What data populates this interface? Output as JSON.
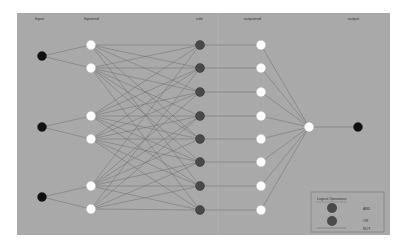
{
  "diagram": {
    "type": "neural-network-fuzzy-logic",
    "background_color": "#a9a9a9",
    "edge_color": "#6e6e6e",
    "columns": [
      {
        "id": "input",
        "label": "Input",
        "x": 42,
        "label_x": 35,
        "node_color": "#111111",
        "nodes_y": [
          56,
          127,
          197
        ]
      },
      {
        "id": "inputrnd",
        "label": "Inputrnd",
        "x": 91,
        "label_x": 84,
        "node_color": "#ffffff",
        "nodes_y": [
          45,
          68,
          116,
          139,
          186,
          209
        ]
      },
      {
        "id": "rule",
        "label": "rule",
        "x": 200,
        "label_x": 196,
        "node_color": "#4a4a4a",
        "nodes_y": [
          45,
          68,
          92,
          116,
          139,
          162,
          186,
          210
        ]
      },
      {
        "id": "outputrnd",
        "label": "outputrnd",
        "x": 261,
        "label_x": 244,
        "node_color": "#ffffff",
        "nodes_y": [
          45,
          68,
          92,
          116,
          139,
          162,
          186,
          210
        ]
      },
      {
        "id": "sum",
        "label": "",
        "x": 309,
        "node_color": "#ffffff",
        "nodes_y": [
          127
        ]
      },
      {
        "id": "output",
        "label": "output",
        "x": 358,
        "label_x": 348,
        "node_color": "#111111",
        "nodes_y": [
          127
        ]
      }
    ],
    "legend": {
      "title": "Logical Operations",
      "items": [
        {
          "label": "AND",
          "symbol": "circle",
          "color": "#4a4a4a"
        },
        {
          "label": "OR",
          "symbol": "circle",
          "color": "#4a4a4a"
        },
        {
          "label": "NOT",
          "symbol": "line",
          "color": "#6e6e6e"
        }
      ]
    }
  }
}
